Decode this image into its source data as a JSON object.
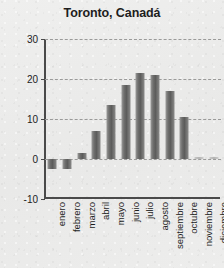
{
  "chart": {
    "title": "Toronto, Canadá"
  },
  "chart_data": {
    "type": "bar",
    "title": "Toronto, Canadá",
    "xlabel": "",
    "ylabel": "",
    "ylim": [
      -10,
      30
    ],
    "yticks": [
      30,
      20,
      10,
      0,
      -10
    ],
    "grid": true,
    "legend": false,
    "categories": [
      "enero",
      "febrero",
      "marzo",
      "abril",
      "mayo",
      "junio",
      "julio",
      "agosto",
      "septiembre",
      "octubre",
      "noviembre",
      "diciembre"
    ],
    "values": [
      -2.5,
      -2.5,
      1.5,
      7,
      13.5,
      18.5,
      21.5,
      21,
      17,
      10.5,
      0.5,
      0.5
    ]
  }
}
